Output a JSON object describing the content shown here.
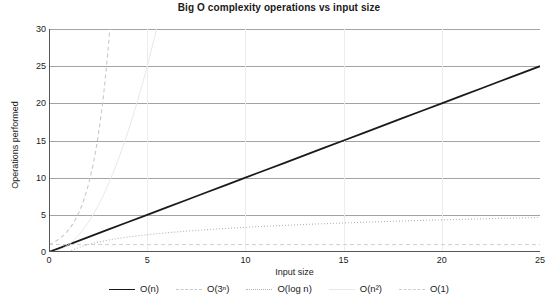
{
  "chart_data": {
    "type": "line",
    "title": "Big O complexity operations vs input size",
    "xlabel": "Input size",
    "ylabel": "Operations performed",
    "xlim": [
      0,
      25
    ],
    "ylim": [
      0,
      30
    ],
    "xticks": [
      "0",
      "5",
      "10",
      "15",
      "20",
      "25"
    ],
    "yticks": [
      "0",
      "5",
      "10",
      "15",
      "20",
      "25",
      "30"
    ],
    "xtick_values": [
      0,
      5,
      10,
      15,
      20,
      25
    ],
    "ytick_values": [
      0,
      5,
      10,
      15,
      20,
      25,
      30
    ],
    "grid": "horizontal-gridlines-on-light-vertical-gridlines",
    "legend_position": "bottom-center",
    "x": [
      0,
      1,
      2,
      3,
      4,
      5,
      6,
      7,
      8,
      9,
      10,
      11,
      12,
      13,
      14,
      15,
      16,
      17,
      18,
      19,
      20,
      21,
      22,
      23,
      24,
      25
    ],
    "series": [
      {
        "name": "O(n)",
        "label": "O(n)",
        "style": "solid",
        "color": "#1a1a1a",
        "width": 1.8,
        "values": [
          0,
          1,
          2,
          3,
          4,
          5,
          6,
          7,
          8,
          9,
          10,
          11,
          12,
          13,
          14,
          15,
          16,
          17,
          18,
          19,
          20,
          21,
          22,
          23,
          24,
          25
        ]
      },
      {
        "name": "O(3^n)",
        "label": "O(3ⁿ)",
        "style": "dashed",
        "color": "#c8c8c8",
        "width": 1.1,
        "values": [
          1,
          3,
          9,
          27,
          81,
          243,
          729,
          2187,
          6561,
          19683,
          59049,
          177147,
          531441,
          1594323,
          4782969,
          14348907,
          43046721,
          129140163,
          387420489,
          1162261467,
          3486784401,
          10460353203,
          31381059609,
          94143178827,
          282429536481,
          847288609443
        ]
      },
      {
        "name": "O(log n)",
        "label": "O(log n)",
        "style": "dotted",
        "color": "#b4b4b4",
        "width": 1.1,
        "values": [
          0,
          0,
          1,
          1.58,
          2,
          2.32,
          2.58,
          2.81,
          3,
          3.17,
          3.32,
          3.46,
          3.58,
          3.7,
          3.81,
          3.91,
          4,
          4.09,
          4.17,
          4.25,
          4.32,
          4.39,
          4.46,
          4.52,
          4.58,
          4.64
        ]
      },
      {
        "name": "O(n^2)",
        "label": "O(n²)",
        "style": "solid-faint",
        "color": "#e8e8e8",
        "width": 1.0,
        "values": [
          0,
          1,
          4,
          9,
          16,
          25,
          36,
          49,
          64,
          81,
          100,
          121,
          144,
          169,
          196,
          225,
          256,
          289,
          324,
          361,
          400,
          441,
          484,
          529,
          576,
          625
        ]
      },
      {
        "name": "O(1)",
        "label": "O(1)",
        "style": "dashed",
        "color": "#cfcfcf",
        "width": 1.0,
        "values": [
          1,
          1,
          1,
          1,
          1,
          1,
          1,
          1,
          1,
          1,
          1,
          1,
          1,
          1,
          1,
          1,
          1,
          1,
          1,
          1,
          1,
          1,
          1,
          1,
          1,
          1
        ]
      }
    ],
    "axis_color": "#555555",
    "gridline_color": "#999999",
    "background": "#ffffff"
  }
}
